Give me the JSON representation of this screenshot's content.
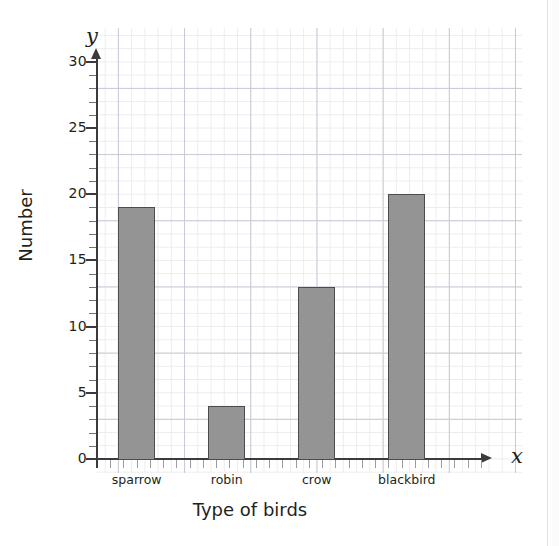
{
  "chart_data": {
    "type": "bar",
    "title": "",
    "xlabel": "Type of birds",
    "ylabel": "Number",
    "x_axis_letter": "x",
    "y_axis_letter": "y",
    "categories": [
      "sparrow",
      "robin",
      "crow",
      "blackbird"
    ],
    "values": [
      19,
      4,
      13,
      20
    ],
    "ylim": [
      0,
      30
    ],
    "ytick_labels": [
      "0",
      "5",
      "10",
      "15",
      "20",
      "25",
      "30"
    ],
    "ytick_values": [
      0,
      5,
      10,
      15,
      20,
      25,
      30
    ],
    "y_minor_tick_step": 1,
    "grid": true,
    "grid_style": "graph-paper",
    "legend": "none",
    "bar_fill_color": "#949494",
    "bar_edge_color": "#4c4c4c",
    "axis_color": "#3b3b3f",
    "grid_major_color": "#c9c9d6",
    "grid_minor_color": "#ececed",
    "background_color": "#ffffff"
  }
}
